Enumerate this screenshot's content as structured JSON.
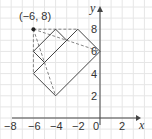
{
  "diagram": {
    "point_label": "(−6, 8)",
    "axes": {
      "x_label": "x",
      "y_label": "y"
    },
    "x_ticks": [
      "−8",
      "−6",
      "−4",
      "−2",
      "0",
      "2"
    ],
    "y_ticks": [
      "2",
      "4",
      "6",
      "8"
    ],
    "colors": {
      "line": "#444444",
      "grid": "#e6e6e6",
      "dash": "#777777"
    },
    "solid_polygons": [
      [
        [
          -6,
          6
        ],
        [
          -4,
          8
        ],
        [
          -3,
          7
        ],
        [
          -5,
          5
        ]
      ],
      [
        [
          -6,
          4
        ],
        [
          -4,
          2
        ],
        [
          0,
          6
        ],
        [
          -2,
          8
        ],
        [
          -3,
          7
        ]
      ]
    ],
    "dashed_lines": [
      [
        [
          -6,
          8
        ],
        [
          -2,
          8
        ]
      ],
      [
        [
          -6,
          8
        ],
        [
          -6,
          4
        ]
      ],
      [
        [
          -6,
          8
        ],
        [
          0,
          6
        ]
      ],
      [
        [
          -6,
          8
        ],
        [
          -4,
          2
        ]
      ]
    ],
    "marked_point": [
      -6,
      8
    ]
  }
}
